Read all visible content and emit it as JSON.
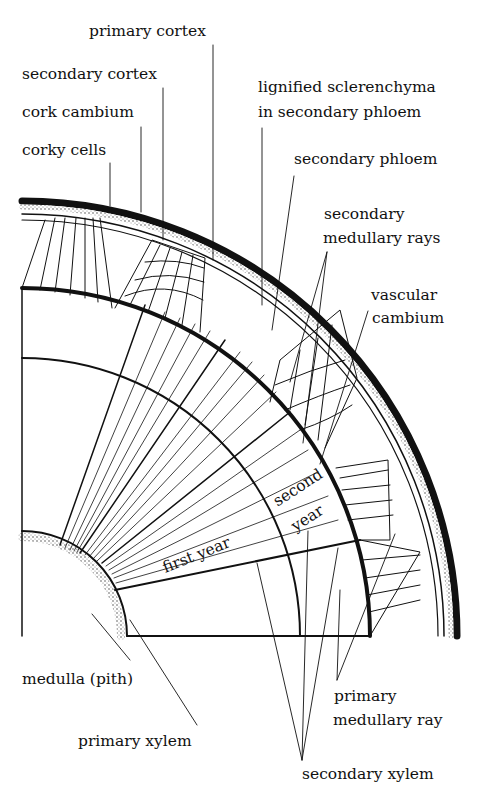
{
  "diagram": {
    "labels": {
      "primary_cortex": "primary cortex",
      "secondary_cortex": "secondary cortex",
      "cork_cambium": "cork cambium",
      "corky_cells": "corky cells",
      "lignified_line1": "lignified sclerenchyma",
      "lignified_line2": "in secondary phloem",
      "secondary_phloem": "secondary phloem",
      "sec_medullary_line1": "secondary",
      "sec_medullary_line2": "medullary rays",
      "vascular_line1": "vascular",
      "vascular_line2": "cambium",
      "medulla": "medulla (pith)",
      "primary_xylem": "primary xylem",
      "primary_medullary_line1": "primary",
      "primary_medullary_line2": "medullary ray",
      "secondary_xylem": "secondary xylem",
      "first_year": "first year",
      "second_year_line1": "second",
      "second_year_line2": "year"
    }
  }
}
